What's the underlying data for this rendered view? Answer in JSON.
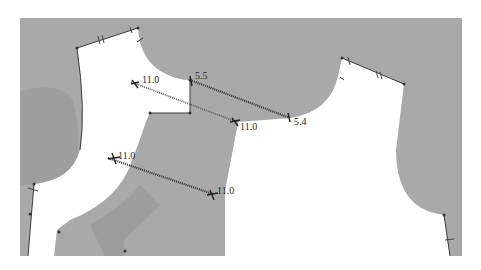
{
  "diagram": {
    "type": "garment-pattern-draft",
    "colors": {
      "background": "#ffffff",
      "pattern_fill": "#a9a9a9",
      "pattern_shade": "#9c9c9c",
      "line": "#333333"
    },
    "measurements": [
      {
        "id": "m1",
        "start_label": "11.0",
        "end_label": "11.0"
      },
      {
        "id": "m2",
        "start_label": "5.5",
        "end_label": "5.4"
      },
      {
        "id": "m3",
        "start_label": "11.0",
        "end_label": "11.0"
      }
    ]
  }
}
